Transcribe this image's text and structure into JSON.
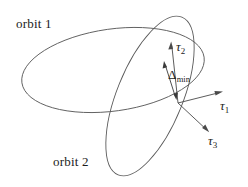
{
  "figure": {
    "width": 248,
    "height": 187,
    "background": "#ffffff",
    "stroke_color": "#5a5a5a",
    "text_color": "#1c1c1c"
  },
  "labels": {
    "orbit1": "orbit 1",
    "orbit2": "orbit 2",
    "tau1_symbol": "τ",
    "tau1_sub": "1",
    "tau2_symbol": "τ",
    "tau2_sub": "2",
    "tau3_symbol": "τ",
    "tau3_sub": "3",
    "delta_symbol": "Δ",
    "delta_sub": "min"
  },
  "diagram_data": {
    "type": "diagram",
    "description": "Two intersecting orbital ellipses with a local minimum-distance vector and a right-handed triad of tau axes at the near point.",
    "orbits": [
      {
        "name": "orbit 1",
        "shape": "ellipse",
        "center": [
          113,
          70
        ],
        "radius_x": 92,
        "radius_y": 41,
        "rotation_deg": -8,
        "label_position": [
          16,
          17
        ]
      },
      {
        "name": "orbit 2",
        "shape": "ellipse",
        "center": [
          150,
          96
        ],
        "radius_x": 33,
        "radius_y": 85,
        "rotation_deg": 22,
        "label_position": [
          53,
          155
        ]
      }
    ],
    "origin": [
      178,
      103
    ],
    "vectors": [
      {
        "name": "tau_1",
        "from": [
          178,
          103
        ],
        "to": [
          222,
          92
        ],
        "label": "τ₁",
        "label_position": [
          220,
          99
        ]
      },
      {
        "name": "tau_2",
        "from": [
          178,
          103
        ],
        "to": [
          171,
          41
        ],
        "label": "τ₂",
        "label_position": [
          176,
          40
        ]
      },
      {
        "name": "tau_3",
        "from": [
          178,
          103
        ],
        "to": [
          209,
          132
        ],
        "label": "τ₃",
        "label_position": [
          208,
          134
        ]
      }
    ],
    "distance_marker": {
      "name": "delta_min",
      "label": "Δmin",
      "from": [
        164,
        61
      ],
      "to": [
        176,
        100
      ],
      "double_headed": true,
      "label_position": [
        168,
        68
      ]
    }
  }
}
